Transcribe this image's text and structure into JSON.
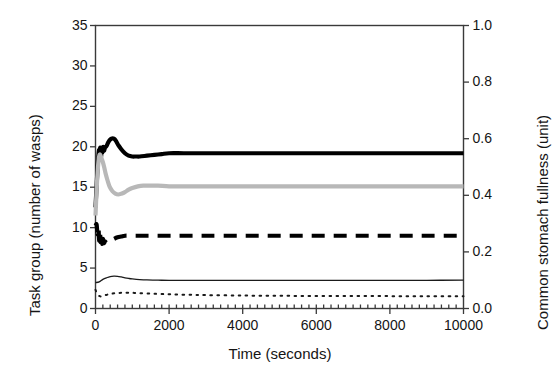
{
  "chart_data": {
    "type": "line",
    "title": "",
    "xlabel": "Time (seconds)",
    "ylabel": "Task group (number of wasps)",
    "ylabel_secondary": "Common stomach fullness (unit)",
    "xlim": [
      0,
      10000
    ],
    "ylim": [
      0,
      35
    ],
    "ylim_secondary": [
      0.0,
      1.0
    ],
    "xticks": [
      0,
      2000,
      4000,
      6000,
      8000,
      10000
    ],
    "xtick_labels": [
      "0",
      "2000",
      "4000",
      "6000",
      "8000",
      "10000"
    ],
    "yticks": [
      0,
      5,
      10,
      15,
      20,
      25,
      30,
      35
    ],
    "ytick_labels": [
      "0",
      "5",
      "10",
      "15",
      "20",
      "25",
      "30",
      "35"
    ],
    "yticks_secondary": [
      0.0,
      0.2,
      0.4,
      0.6,
      0.8,
      1.0
    ],
    "ytick_labels_secondary": [
      "0.0",
      "0.2",
      "0.4",
      "0.6",
      "0.8",
      "1.0"
    ],
    "grid": false,
    "legend": "none",
    "x_minor_ticks": true,
    "series": [
      {
        "name": "task-group-thick-solid-black",
        "axis": "left",
        "color": "#000000",
        "style": "solid",
        "width": 4.2,
        "x": [
          0,
          40,
          70,
          95,
          110,
          130,
          150,
          170,
          190,
          210,
          230,
          260,
          300,
          340,
          380,
          430,
          500,
          560,
          620,
          700,
          800,
          900,
          1000,
          1100,
          1200,
          1400,
          1600,
          1800,
          2000,
          2400,
          3000,
          4000,
          5000,
          6000,
          7000,
          8000,
          9000,
          10000
        ],
        "y": [
          12.5,
          16.0,
          18.4,
          19.6,
          19.1,
          19.9,
          18.8,
          19.8,
          19.3,
          20.0,
          19.5,
          19.9,
          20.1,
          20.5,
          20.8,
          21.0,
          21.0,
          20.7,
          20.2,
          19.7,
          19.2,
          18.9,
          18.8,
          18.8,
          18.8,
          18.9,
          19.0,
          19.1,
          19.2,
          19.2,
          19.2,
          19.2,
          19.2,
          19.2,
          19.2,
          19.2,
          19.2,
          19.2
        ]
      },
      {
        "name": "task-group-thick-solid-grey",
        "axis": "left",
        "color": "#b8b8b8",
        "style": "solid",
        "width": 4.2,
        "x": [
          0,
          40,
          80,
          110,
          140,
          170,
          200,
          240,
          280,
          330,
          390,
          460,
          540,
          620,
          700,
          800,
          900,
          1000,
          1150,
          1300,
          1500,
          1700,
          2000,
          2400,
          3000,
          4000,
          5000,
          6000,
          7000,
          8000,
          9000,
          10000
        ],
        "y": [
          11.5,
          15.5,
          18.2,
          19.0,
          18.9,
          18.5,
          18.1,
          17.4,
          16.6,
          15.8,
          15.0,
          14.5,
          14.2,
          14.1,
          14.2,
          14.4,
          14.7,
          14.9,
          15.1,
          15.2,
          15.2,
          15.2,
          15.1,
          15.1,
          15.1,
          15.1,
          15.1,
          15.1,
          15.1,
          15.1,
          15.1,
          15.1
        ]
      },
      {
        "name": "task-group-thick-dashed-black",
        "axis": "left",
        "color": "#000000",
        "style": "dashed",
        "width": 4.2,
        "dash": "13,9",
        "x": [
          0,
          30,
          55,
          80,
          100,
          120,
          140,
          160,
          180,
          200,
          230,
          260,
          300,
          350,
          420,
          500,
          600,
          700,
          800,
          950,
          1100,
          1300,
          1500,
          1800,
          2200,
          3000,
          4000,
          5000,
          6000,
          7000,
          8000,
          9000,
          10000
        ],
        "y": [
          10.2,
          10.4,
          9.2,
          10.0,
          8.4,
          9.5,
          8.2,
          9.0,
          8.0,
          8.6,
          8.1,
          8.3,
          8.1,
          8.2,
          8.4,
          8.6,
          8.8,
          8.9,
          9.0,
          9.0,
          9.0,
          9.0,
          9.0,
          9.0,
          9.0,
          9.0,
          9.0,
          9.0,
          9.0,
          9.0,
          9.0,
          9.0,
          9.0
        ]
      },
      {
        "name": "task-group-thin-solid-black",
        "axis": "left",
        "color": "#1a1a1a",
        "style": "solid",
        "width": 1.3,
        "x": [
          0,
          100,
          200,
          300,
          400,
          500,
          600,
          700,
          800,
          900,
          1000,
          1200,
          1400,
          1700,
          2000,
          2500,
          3000,
          4000,
          5000,
          6000,
          7000,
          8000,
          9000,
          10000
        ],
        "y": [
          3.2,
          3.3,
          3.6,
          3.8,
          3.95,
          4.0,
          3.98,
          3.9,
          3.8,
          3.72,
          3.66,
          3.58,
          3.53,
          3.5,
          3.48,
          3.47,
          3.47,
          3.47,
          3.47,
          3.48,
          3.48,
          3.49,
          3.49,
          3.5
        ]
      },
      {
        "name": "common-stomach-fullness-dotted-black",
        "axis": "left",
        "color": "#1a1a1a",
        "style": "dotted",
        "width": 2.0,
        "dash": "1.6,5.4",
        "x": [
          0,
          60,
          130,
          200,
          280,
          360,
          450,
          550,
          650,
          780,
          900,
          1050,
          1200,
          1400,
          1600,
          1900,
          2200,
          2600,
          3000,
          4000,
          5000,
          6000,
          7000,
          8000,
          9000,
          10000
        ],
        "y": [
          2.3,
          1.72,
          1.5,
          1.55,
          1.66,
          1.76,
          1.84,
          1.9,
          1.93,
          1.95,
          1.95,
          1.93,
          1.9,
          1.86,
          1.82,
          1.77,
          1.73,
          1.69,
          1.66,
          1.6,
          1.57,
          1.55,
          1.54,
          1.53,
          1.52,
          1.52
        ]
      }
    ]
  },
  "axes": {
    "left_title": "Task group (number of wasps)",
    "right_title": "Common stomach fullness (unit)",
    "bottom_title": "Time (seconds)"
  },
  "colors": {
    "frame": "#3a3a3a",
    "line_black": "#000000",
    "line_grey": "#b8b8b8",
    "background": "#ffffff"
  }
}
